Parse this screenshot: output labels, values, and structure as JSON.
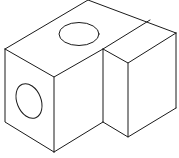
{
  "diagram": {
    "type": "isometric-line-drawing",
    "stroke_color": "#1a1a1a",
    "background": "#ffffff",
    "parts": [
      {
        "name": "main-block",
        "holes": [
          "top-face-hole",
          "left-face-hole"
        ]
      },
      {
        "name": "step-block"
      }
    ]
  }
}
